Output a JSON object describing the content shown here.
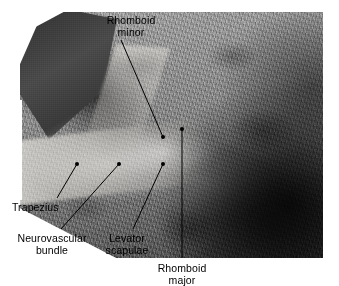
{
  "figure": {
    "kind": "anatomical-dissection-photograph",
    "region": "posterior neck and upper back, superficial muscles reflected",
    "background_color": "#ffffff",
    "photo": {
      "left": 20,
      "top": 12,
      "width": 303,
      "height": 246,
      "tone": "grayscale",
      "dominant_colors": [
        "#8d8d8d",
        "#414141",
        "#e4e2dc",
        "#2e2e2e"
      ]
    }
  },
  "annotations": [
    {
      "id": "rhomboid-minor",
      "text_lines": [
        "Rhomboid",
        "minor"
      ],
      "align": "center",
      "label_x": 96,
      "label_y": 14,
      "label_width": 70,
      "leader": {
        "x1": 121,
        "y1": 40,
        "x2": 163,
        "y2": 137
      },
      "dot": {
        "x": 163,
        "y": 137
      }
    },
    {
      "id": "trapezius",
      "text_lines": [
        "Trapezius"
      ],
      "align": "left",
      "label_x": 12,
      "label_y": 201,
      "label_width": 60,
      "leader": {
        "x1": 57,
        "y1": 198,
        "x2": 77,
        "y2": 164
      },
      "dot": {
        "x": 77,
        "y": 164
      }
    },
    {
      "id": "neurovascular-bundle",
      "text_lines": [
        "Neurovascular",
        "bundle"
      ],
      "align": "center",
      "label_x": 10,
      "label_y": 232,
      "label_width": 84,
      "leader": {
        "x1": 61,
        "y1": 229,
        "x2": 119,
        "y2": 164
      },
      "dot": {
        "x": 119,
        "y": 164
      }
    },
    {
      "id": "levator-scapulae",
      "text_lines": [
        "Levator",
        "scapulae"
      ],
      "align": "center",
      "label_x": 99,
      "label_y": 232,
      "label_width": 56,
      "leader": {
        "x1": 133,
        "y1": 229,
        "x2": 163,
        "y2": 164
      },
      "dot": {
        "x": 163,
        "y": 164
      }
    },
    {
      "id": "rhomboid-major",
      "text_lines": [
        "Rhomboid",
        "major"
      ],
      "align": "center",
      "label_x": 147,
      "label_y": 262,
      "label_width": 70,
      "leader": {
        "x1": 182,
        "y1": 129,
        "x2": 182,
        "y2": 258
      },
      "dot": {
        "x": 182,
        "y": 129
      }
    }
  ],
  "style": {
    "leader_color": "#000000",
    "leader_width": 1,
    "dot_radius": 2,
    "text_color": "#000000",
    "font_size_px": 10.5
  }
}
